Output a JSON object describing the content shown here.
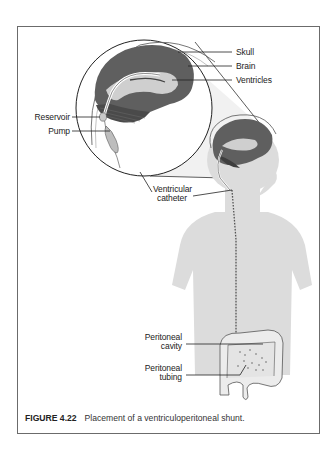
{
  "figure": {
    "number": "FIGURE 4.22",
    "caption": "Placement of a ventriculoperitoneal shunt."
  },
  "labels": {
    "skull": "Skull",
    "brain": "Brain",
    "ventricles": "Ventricles",
    "reservoir": "Reservoir",
    "pump": "Pump",
    "ventricular_catheter_line1": "Ventricular",
    "ventricular_catheter_line2": "catheter",
    "peritoneal_cavity_line1": "Peritoneal",
    "peritoneal_cavity_line2": "cavity",
    "peritoneal_tubing_line1": "Peritoneal",
    "peritoneal_tubing_line2": "tubing"
  },
  "colors": {
    "frame": "#6b6b6b",
    "brain_cortex": "#5f5f5f",
    "brain_inner": "#cfcfcf",
    "cerebellum": "#4a4a4a",
    "body_silhouette": "#dcdcdc",
    "leader_line": "#222222"
  }
}
